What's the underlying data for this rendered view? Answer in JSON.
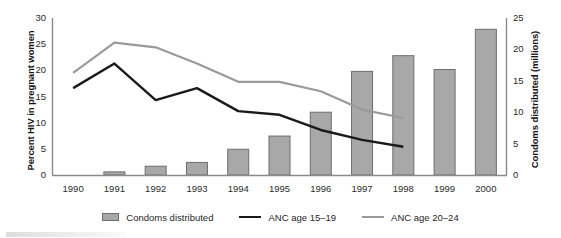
{
  "chart_data": {
    "type": "bar",
    "title": "",
    "subtitle": "",
    "xlabel": "",
    "categories": [
      "1990",
      "1991",
      "1992",
      "1993",
      "1994",
      "1995",
      "1996",
      "1997",
      "1998",
      "1999",
      "2000"
    ],
    "grid": false,
    "legend_position": "bottom",
    "axes": {
      "left": {
        "label": "Percent HIV in pregnant women",
        "ticks": [
          0,
          5,
          10,
          15,
          20,
          25,
          30
        ],
        "tick_labels": [
          "0",
          "5",
          "10",
          "15",
          "20",
          "25",
          "30"
        ],
        "range": [
          0,
          30
        ]
      },
      "right": {
        "label": "Condoms distributed (millions)",
        "ticks": [
          0,
          5,
          10,
          15,
          20,
          25
        ],
        "tick_labels": [
          "0",
          "5",
          "10",
          "15",
          "20",
          "25"
        ],
        "range": [
          0,
          25
        ]
      }
    },
    "series": [
      {
        "name": "Condoms distributed",
        "type": "bar",
        "axis": "right",
        "unit": "millions",
        "color": "#a8a8a8",
        "border_color": "#6d6d6d",
        "values": [
          0,
          0.5,
          1.4,
          2.0,
          4.1,
          6.2,
          10.0,
          16.5,
          19.0,
          16.8,
          23.2
        ]
      },
      {
        "name": "ANC age 15–19",
        "type": "line",
        "axis": "left",
        "unit": "percent",
        "color": "#1a1a1a",
        "values": [
          16.6,
          21.3,
          14.3,
          16.6,
          12.2,
          11.5,
          8.6,
          6.7,
          5.4,
          null,
          null
        ]
      },
      {
        "name": "ANC age 20–24",
        "type": "line",
        "axis": "left",
        "unit": "percent",
        "color": "#9a9a9a",
        "values": [
          19.5,
          25.3,
          24.4,
          21.3,
          17.8,
          17.8,
          16.0,
          12.5,
          10.9,
          null,
          null
        ]
      }
    ]
  },
  "legend": {
    "items": [
      {
        "label": "Condoms distributed",
        "marker": "bar-swatch",
        "color": "#a8a8a8"
      },
      {
        "label": "ANC age 15–19",
        "marker": "line-swatch",
        "color": "#1a1a1a"
      },
      {
        "label": "ANC age 20–24",
        "marker": "line-swatch",
        "color": "#9a9a9a"
      }
    ]
  }
}
